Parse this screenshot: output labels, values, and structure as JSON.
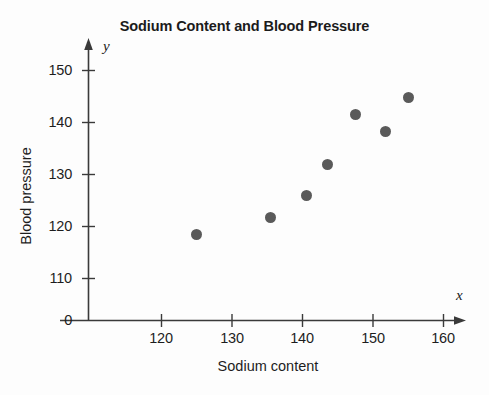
{
  "chart_data": {
    "type": "scatter",
    "title": "Sodium Content and Blood Pressure",
    "xlabel": "Sodium content",
    "ylabel": "Blood pressure",
    "x_axis_variable": "x",
    "y_axis_variable": "y",
    "xlim": [
      113,
      163
    ],
    "ylim": [
      105,
      154
    ],
    "xticks": [
      120,
      130,
      140,
      150,
      160
    ],
    "yticks": [
      0,
      110,
      120,
      130,
      140,
      150
    ],
    "xtick_labels": [
      "120",
      "130",
      "140",
      "150",
      "160"
    ],
    "ytick_labels": [
      "150",
      "140",
      "130",
      "120",
      "110",
      "0"
    ],
    "grid": false,
    "legend": null,
    "axis_style": "arrow-terminated-axes-with-broken-y-scale",
    "marker_color": "#5a5a5a",
    "marker_size_px": 11,
    "points": [
      {
        "x": 125.0,
        "y": 118.5
      },
      {
        "x": 135.5,
        "y": 121.8
      },
      {
        "x": 140.5,
        "y": 126.0
      },
      {
        "x": 143.5,
        "y": 132.0
      },
      {
        "x": 147.5,
        "y": 141.5
      },
      {
        "x": 151.8,
        "y": 138.3
      },
      {
        "x": 155.0,
        "y": 144.8
      }
    ]
  },
  "colors": {
    "marker": "#5a5a5a",
    "axis": "#3a3a3a",
    "text": "#1d1d1d",
    "background": "#fdfdfd"
  }
}
